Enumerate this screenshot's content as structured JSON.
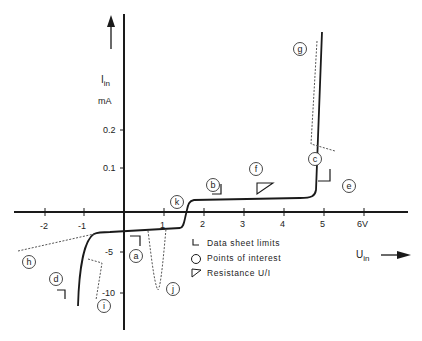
{
  "diagram": {
    "y_axis": {
      "label_main": "I",
      "label_sub": "in",
      "unit": "mA",
      "ticks_positive": [
        {
          "label": "0.2",
          "value": 0.2
        },
        {
          "label": "0.1",
          "value": 0.1
        }
      ],
      "ticks_negative": [
        {
          "label": "-5",
          "value": -5
        },
        {
          "label": "-10",
          "value": -10
        }
      ]
    },
    "x_axis": {
      "label_main": "U",
      "label_sub": "in",
      "ticks": [
        {
          "label": "-2",
          "value": -2
        },
        {
          "label": "-1",
          "value": -1
        },
        {
          "label": "1",
          "value": 1
        },
        {
          "label": "2",
          "value": 2
        },
        {
          "label": "3",
          "value": 3
        },
        {
          "label": "4",
          "value": 4
        },
        {
          "label": "5",
          "value": 5
        },
        {
          "label": "6V",
          "value": 6
        }
      ]
    },
    "markers": {
      "a": "a",
      "b": "b",
      "c": "c",
      "d": "d",
      "e": "e",
      "f": "f",
      "g": "g",
      "h": "h",
      "i": "i",
      "j": "j",
      "k": "k"
    },
    "legend": [
      {
        "symbol": "corner-bracket",
        "label": "Data sheet limits"
      },
      {
        "symbol": "circle",
        "label": "Points of interest"
      },
      {
        "symbol": "triangle",
        "label": "Resistance U/I"
      }
    ],
    "colors": {
      "line": "#1a1a1a",
      "dotted": "#555555",
      "text": "#222222"
    }
  }
}
